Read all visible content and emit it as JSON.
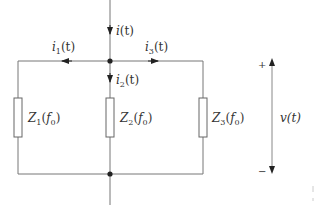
{
  "diagram": {
    "type": "parallel-impedance-circuit",
    "colors": {
      "wire": "#777777",
      "text": "#333333",
      "node": "#222222"
    },
    "currents": [
      {
        "id": "i",
        "base": "i",
        "sub": "",
        "arg": "(t)",
        "direction": "down",
        "label": "i(t)"
      },
      {
        "id": "i1",
        "base": "i",
        "sub": "1",
        "arg": "(t)",
        "direction": "left",
        "label": "i1(t)"
      },
      {
        "id": "i2",
        "base": "i",
        "sub": "2",
        "arg": "(t)",
        "direction": "down",
        "label": "i2(t)"
      },
      {
        "id": "i3",
        "base": "i",
        "sub": "3",
        "arg": "(t)",
        "direction": "right",
        "label": "i3(t)"
      }
    ],
    "impedances": [
      {
        "id": "Z1",
        "base": "Z",
        "sub": "1",
        "arg_open": "(",
        "f": "f",
        "f_sub": "0",
        "arg_close": ")"
      },
      {
        "id": "Z2",
        "base": "Z",
        "sub": "2",
        "arg_open": "(",
        "f": "f",
        "f_sub": "0",
        "arg_close": ")"
      },
      {
        "id": "Z3",
        "base": "Z",
        "sub": "3",
        "arg_open": "(",
        "f": "f",
        "f_sub": "0",
        "arg_close": ")"
      }
    ],
    "voltage": {
      "label": "v(t)",
      "plus": "+",
      "minus": "−"
    }
  }
}
